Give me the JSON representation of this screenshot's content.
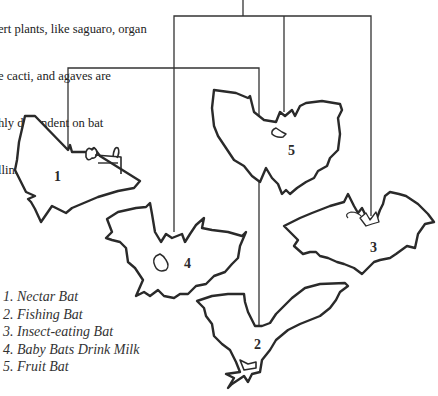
{
  "intro_text": {
    "lines": [
      "ert plants, like saguaro, organ",
      "e cacti, and agaves are",
      "hly dependent on bat",
      "llinators."
    ]
  },
  "mobile": {
    "bats": [
      {
        "number": "1",
        "name": "Nectar Bat"
      },
      {
        "number": "2",
        "name": "Fishing Bat"
      },
      {
        "number": "3",
        "name": "Insect-eating Bat"
      },
      {
        "number": "4",
        "name": "Baby Bats Drink Milk"
      },
      {
        "number": "5",
        "name": "Fruit Bat"
      }
    ]
  },
  "legend": {
    "items": [
      "1. Nectar Bat",
      "2. Fishing Bat",
      "3. Insect-eating Bat",
      "4. Baby Bats Drink Milk",
      "5. Fruit Bat"
    ]
  },
  "colors": {
    "line": "#333333",
    "outline": "#2a2a2a",
    "background": "#ffffff"
  }
}
